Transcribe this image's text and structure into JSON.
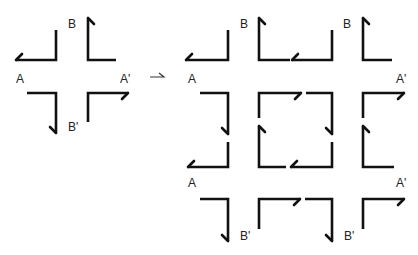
{
  "diagram": {
    "title": "",
    "left_figure": {
      "labels": {
        "a": "A",
        "a_prime": "A'",
        "b": "B",
        "b_prime": "B'"
      },
      "description": "Four L-shaped directed edges around a cross-shaped gap, identifying edges A-A' and B-B'"
    },
    "transform_arrow": "→",
    "right_figure": {
      "labels": {
        "a_top": "A",
        "a_bottom": "A",
        "a_prime_top": "A'",
        "a_prime_bottom": "A'",
        "b_left": "B",
        "b_right": "B",
        "b_prime_left": "B'",
        "b_prime_right": "B'"
      },
      "description": "3x3 tiling of L-shaped directed edges forming a grid with a central square"
    },
    "colors": {
      "stroke": "#111111",
      "background": "#ffffff"
    }
  }
}
